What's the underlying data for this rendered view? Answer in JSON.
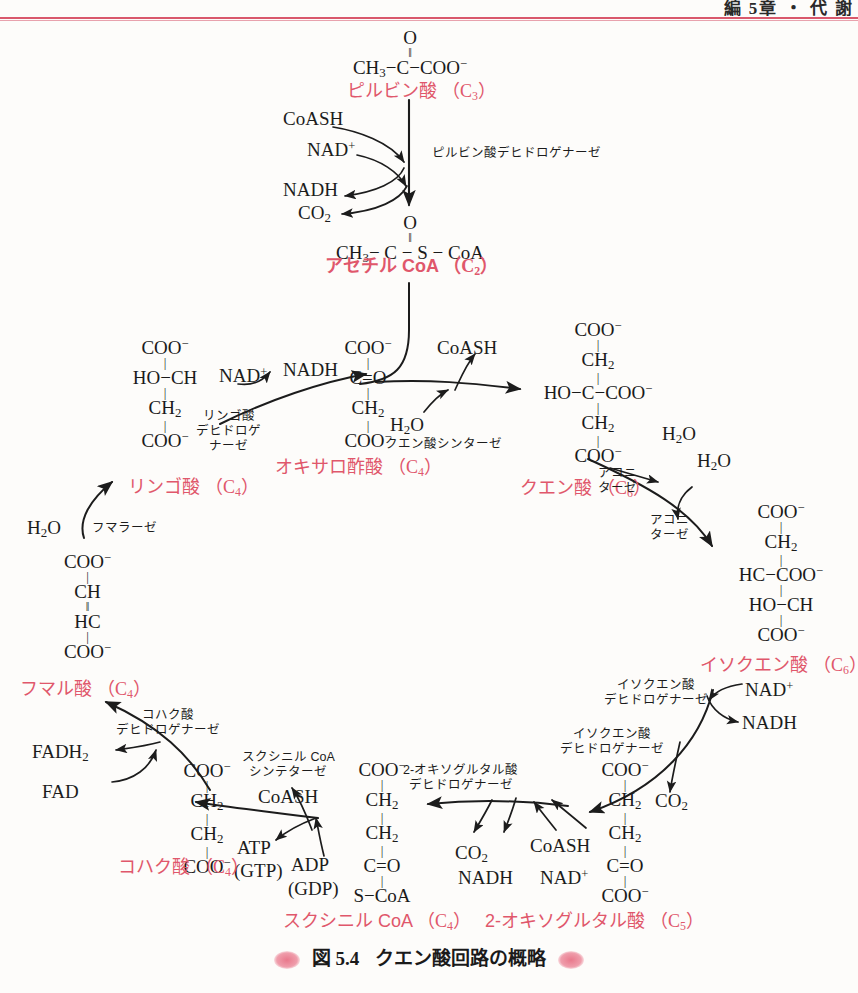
{
  "page": {
    "header_text": "編 5章 ・ 代 謝",
    "caption_label": "図 5.4",
    "caption_title": "クエン酸回路の概略",
    "accent_red": "#e0576b",
    "rule_red": "#d9586c",
    "ink": "#1c1c1c"
  },
  "compounds": {
    "pyruvate": {
      "name": "ピルビン酸",
      "carbons": "（C3）"
    },
    "acetyl_coa": {
      "name": "アセチル CoA",
      "carbons": "（C2）"
    },
    "oxaloacetate": {
      "name": "オキサロ酢酸",
      "carbons": "（C4）"
    },
    "citrate": {
      "name": "クエン酸",
      "carbons": "（C6）"
    },
    "isocitrate": {
      "name": "イソクエン酸",
      "carbons": "（C6）"
    },
    "oxoglutarate": {
      "name": "2-オキソグルタル酸",
      "carbons": "（C5）"
    },
    "succinyl_coa": {
      "name": "スクシニル CoA",
      "carbons": "（C4）"
    },
    "succinate": {
      "name": "コハク酸",
      "carbons": "（C4）"
    },
    "fumarate": {
      "name": "フマル酸",
      "carbons": "（C4）"
    },
    "malate": {
      "name": "リンゴ酸",
      "carbons": "（C4）"
    }
  },
  "enzymes": {
    "pyruvate_dehydrogenase": "ピルビン酸デヒドロゲナーゼ",
    "citrate_synthase": "クエン酸シンターゼ",
    "aconitase_1": "アコニ\nターゼ",
    "aconitase_2": "アコニ\nターゼ",
    "isocitrate_dehydrogenase_1": "イソクエン酸\nデヒドロゲナーゼ",
    "isocitrate_dehydrogenase_2": "イソクエン酸\nデヒドロゲナーゼ",
    "oxoglutarate_dehydrogenase": "2-オキソグルタル酸\nデヒドロゲナーゼ",
    "succinyl_coa_synthetase": "スクシニル CoA\nシンテターゼ",
    "succinate_dehydrogenase": "コハク酸\nデヒドロゲナーゼ",
    "fumarase": "フマラーゼ",
    "malate_dehydrogenase": "リンゴ酸\nデヒドロゲ\nナーゼ"
  },
  "cofactors": {
    "coash_1": "CoASH",
    "nad_plus_1": "NAD",
    "nadh_1": "NADH",
    "co2_1": "CO",
    "coash_2": "CoASH",
    "h2o_citratesynthase": "H",
    "h2o_aconitase_out": "H",
    "h2o_aconitase_in": "H",
    "nad_plus_icdh": "NAD",
    "nadh_icdh": "NADH",
    "co2_icdh": "CO",
    "coash_ogdh": "CoASH",
    "nad_plus_ogdh": "NAD",
    "nadh_ogdh": "NADH",
    "co2_ogdh": "CO",
    "atp": "ATP",
    "gtp": "(GTP)",
    "adp": "ADP",
    "gdp": "(GDP)",
    "coash_scs": "CoASH",
    "fad": "FAD",
    "fadh2": "FADH",
    "h2o_fumarase": "H",
    "nad_plus_mdh": "NAD",
    "nadh_mdh": "NADH"
  },
  "structures": {
    "pyruvate": [
      "O",
      "‖",
      "CH3−C−COO−"
    ],
    "acetyl_coa": [
      "O",
      "‖",
      "CH3− C − S − CoA"
    ],
    "oxaloacetate": [
      "COO−",
      "C=O",
      "CH2",
      "COO−"
    ],
    "citrate": [
      "COO−",
      "CH2",
      "HO−C−COO−",
      "CH2",
      "COO−"
    ],
    "isocitrate": [
      "COO−",
      "CH2",
      "HC−COO−",
      "HO−CH",
      "COO−"
    ],
    "oxoglutarate": [
      "COO−",
      "CH2",
      "CH2",
      "C=O",
      "COO−"
    ],
    "succinyl_coa": [
      "COO−",
      "CH2",
      "CH2",
      "C=O",
      "S−CoA"
    ],
    "succinate": [
      "COO−",
      "CH2",
      "CH2",
      "COO−"
    ],
    "fumarate": [
      "COO−",
      "CH",
      "HC",
      "COO−"
    ],
    "malate": [
      "COO−",
      "HO−CH",
      "CH2",
      "COO−"
    ]
  }
}
